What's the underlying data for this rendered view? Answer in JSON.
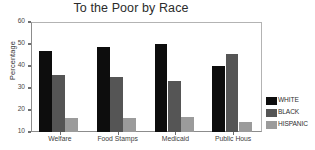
{
  "chart_data": {
    "type": "bar",
    "title": "To the Poor by Race",
    "xlabel": "",
    "ylabel": "Percentage",
    "categories": [
      "Welfare",
      "Food Stamps",
      "Medicaid",
      "Public Hous"
    ],
    "series": [
      {
        "name": "WHITE",
        "color": "#0d0d0d",
        "values": [
          47.0,
          48.5,
          50.0,
          40.0
        ]
      },
      {
        "name": "BLACK",
        "color": "#555555",
        "values": [
          36.0,
          34.8,
          33.0,
          45.5
        ]
      },
      {
        "name": "HISPANIC",
        "color": "#9b9b9b",
        "values": [
          16.5,
          16.5,
          17.0,
          14.5
        ]
      }
    ],
    "ylim": [
      10,
      60
    ],
    "yticks": [
      10,
      20,
      30,
      40,
      50,
      60
    ],
    "ytick_labels": [
      "10",
      "20",
      "30",
      "40",
      "50",
      "60"
    ],
    "grid": false,
    "legend_position": "right"
  }
}
